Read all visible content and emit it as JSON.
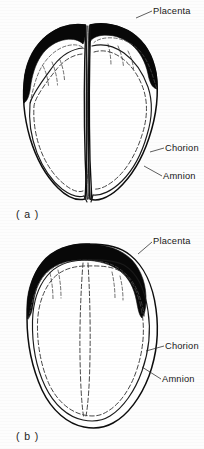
{
  "figure": {
    "ink_color": "#0d0d0d",
    "placenta_color": "#080808",
    "background_color": "#fdfdfd"
  },
  "panels": [
    {
      "id": "a",
      "caption": "( a )",
      "type": "dichorionic-diamniotic",
      "labels": {
        "placenta": "Placenta",
        "chorion": "Chorion",
        "amnion": "Amnion"
      }
    },
    {
      "id": "b",
      "caption": "( b )",
      "type": "monochorionic-diamniotic",
      "labels": {
        "placenta": "Placenta",
        "chorion": "Chorion",
        "amnion": "Amnion"
      }
    }
  ]
}
